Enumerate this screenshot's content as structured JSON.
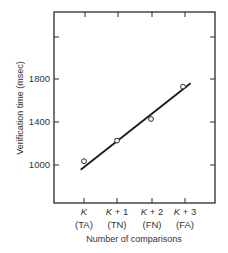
{
  "chart_data": {
    "type": "line",
    "title": "",
    "xlabel": "Number of comparisons",
    "ylabel": "Verification time (msec)",
    "categories": [
      {
        "main": "K",
        "suffix": "",
        "sub": "(TA)"
      },
      {
        "main": "K",
        "suffix": " + 1",
        "sub": "(TN)"
      },
      {
        "main": "K",
        "suffix": " + 2",
        "sub": "(FN)"
      },
      {
        "main": "K",
        "suffix": " + 3",
        "sub": "(FA)"
      }
    ],
    "category_labels": [
      "K (TA)",
      "K + 1 (TN)",
      "K + 2 (FN)",
      "K + 3 (FA)"
    ],
    "series": [
      {
        "name": "observed",
        "marker": "open-circle",
        "values": [
          1040,
          1230,
          1430,
          1730
        ]
      },
      {
        "name": "fitted line",
        "marker": "none",
        "values": [
          970,
          1240,
          1480,
          1760
        ]
      }
    ],
    "fit_line": {
      "x_start": -0.1,
      "y_start": 960,
      "x_end": 3.2,
      "y_end": 1760
    },
    "yticks": [
      1000,
      1400,
      1800
    ],
    "yticks_unlabeled": [
      2200
    ],
    "ylim": [
      580,
      2350
    ],
    "grid": false,
    "legend": "none",
    "frame": "box with inward ticks on all sides"
  }
}
